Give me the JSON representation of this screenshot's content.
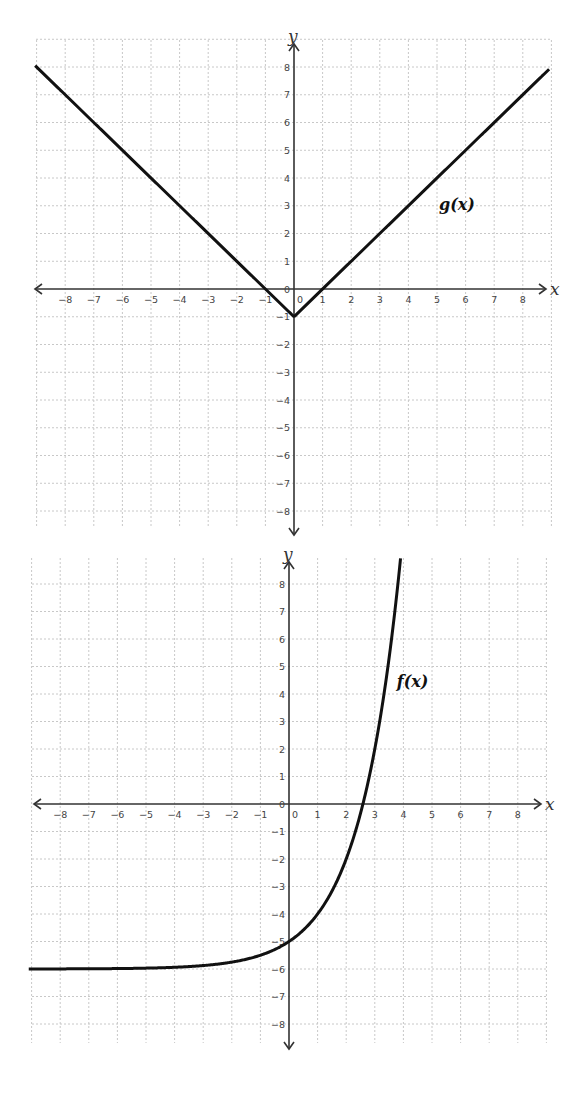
{
  "chart_data": [
    {
      "type": "line",
      "title": "",
      "function_label": "g(x)",
      "expression": "g(x) = |x| - 1",
      "xlabel": "x",
      "ylabel": "y",
      "xlim": [
        -9,
        9
      ],
      "ylim": [
        -8.8,
        9
      ],
      "x_ticks": [
        -8,
        -7,
        -6,
        -5,
        -4,
        -3,
        -2,
        -1,
        0,
        1,
        2,
        3,
        4,
        5,
        6,
        7,
        8
      ],
      "y_ticks": [
        -8,
        -7,
        -6,
        -5,
        -4,
        -3,
        -2,
        -1,
        0,
        1,
        2,
        3,
        4,
        5,
        6,
        7,
        8
      ],
      "grid": true,
      "series": [
        {
          "name": "g(x)",
          "x": [
            -9,
            -8,
            -6,
            -4,
            -2,
            -1,
            0,
            1,
            2,
            4,
            6,
            8,
            8.9
          ],
          "y": [
            8,
            7,
            5,
            3,
            1,
            0,
            -1,
            0,
            1,
            3,
            5,
            7,
            7.9
          ]
        }
      ],
      "key_points": {
        "vertex": [
          0,
          -1
        ],
        "x_intercepts": [
          -1,
          1
        ],
        "y_intercept": -1
      },
      "label_position": [
        5,
        3
      ]
    },
    {
      "type": "line",
      "title": "",
      "function_label": "f(x)",
      "expression": "f(x) = 2^x - 6",
      "xlabel": "x",
      "ylabel": "y",
      "xlim": [
        -9,
        9
      ],
      "ylim": [
        -8.8,
        9
      ],
      "x_ticks": [
        -8,
        -7,
        -6,
        -5,
        -4,
        -3,
        -2,
        -1,
        0,
        1,
        2,
        3,
        4,
        5,
        6,
        7,
        8
      ],
      "y_ticks": [
        -8,
        -7,
        -6,
        -5,
        -4,
        -3,
        -2,
        -1,
        0,
        1,
        2,
        3,
        4,
        5,
        6,
        7,
        8
      ],
      "grid": true,
      "series": [
        {
          "name": "f(x)",
          "x": [
            -9,
            -6,
            -4,
            -3,
            -2,
            -1,
            0,
            1,
            2,
            2.58,
            3,
            3.5,
            3.81,
            3.9
          ],
          "y": [
            -5.998,
            -5.98,
            -5.94,
            -5.88,
            -5.75,
            -5.5,
            -5,
            -4,
            -2,
            0,
            2,
            5.31,
            8,
            8.93
          ]
        }
      ],
      "key_points": {
        "horizontal_asymptote": -6,
        "y_intercept": -5,
        "x_intercept": 2.58
      },
      "label_position": [
        3.7,
        4.4
      ]
    }
  ]
}
